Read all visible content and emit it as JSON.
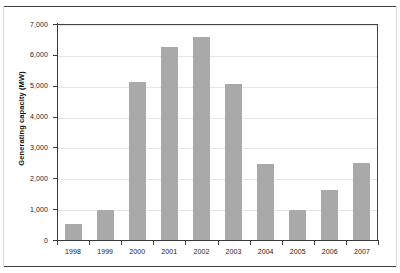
{
  "chart_data": {
    "type": "bar",
    "title": "",
    "xlabel": "",
    "ylabel": "Generating capacity (MW)",
    "categories": [
      "1998",
      "1999",
      "2000",
      "2001",
      "2002",
      "2003",
      "2004",
      "2005",
      "2006",
      "2007"
    ],
    "values": [
      550,
      1000,
      5150,
      6300,
      6600,
      5100,
      2500,
      1000,
      1650,
      2520
    ],
    "ylim": [
      0,
      7000
    ],
    "ytick_values": [
      0,
      1000,
      2000,
      3000,
      4000,
      5000,
      6000,
      7000
    ],
    "ytick_labels": [
      "0",
      "1,000",
      "2,000",
      "3,000",
      "4,000",
      "5,000",
      "6,000",
      "7,000"
    ],
    "grid": true,
    "legend": false,
    "bar_color": "#a9a9a9",
    "gridline_color": "#e6e6e6",
    "axis_color": "#3a3a3a",
    "plot_background": "#ffffff"
  }
}
